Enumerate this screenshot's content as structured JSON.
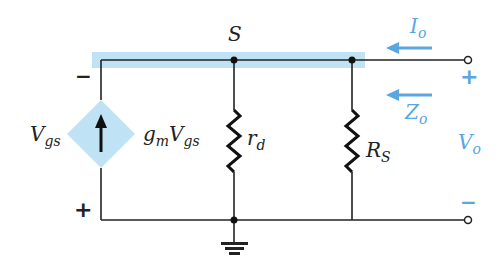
{
  "diagram": {
    "type": "circuit",
    "nodes": {
      "source": "S"
    },
    "components": {
      "current_source": {
        "label_main": "g",
        "label_m": "m",
        "label_V": "V",
        "label_gs": "gs"
      },
      "rd": {
        "main": "r",
        "sub": "d"
      },
      "rs": {
        "main": "R",
        "sub": "S"
      }
    },
    "vgs": {
      "main": "V",
      "sub": "gs",
      "top_sign": "−",
      "bottom_sign": "+"
    },
    "output": {
      "current": {
        "main": "I",
        "sub": "o"
      },
      "impedance": {
        "main": "Z",
        "sub": "o"
      },
      "voltage": {
        "main": "V",
        "sub": "o"
      },
      "plus": "+",
      "minus": "−"
    },
    "colors": {
      "highlight": "#bfe3f5",
      "accent": "#5aa6de",
      "wire": "#222222",
      "source_fill": "#bfe3f5"
    }
  }
}
